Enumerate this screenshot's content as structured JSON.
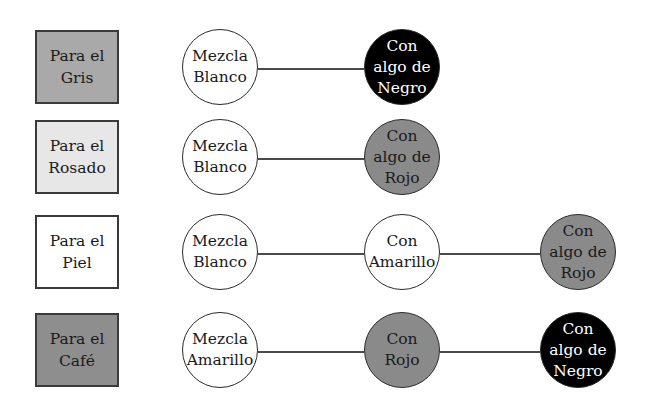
{
  "colors": {
    "gray_box": "#a9a9a9",
    "pink_box": "#e7e7e7",
    "skin_box": "#ffffff",
    "brown_box": "#8e8e8e",
    "white_circle": "#ffffff",
    "red_circle": "#8a8a8a",
    "black_circle": "#000000"
  },
  "rows": [
    {
      "box_label": "Para el\nGris",
      "steps": [
        "Mezcla\nBlanco",
        "Con\nalgo de\nNegro"
      ]
    },
    {
      "box_label": "Para el\nRosado",
      "steps": [
        "Mezcla\nBlanco",
        "Con\nalgo de\nRojo"
      ]
    },
    {
      "box_label": "Para el\nPiel",
      "steps": [
        "Mezcla\nBlanco",
        "Con\nAmarillo",
        "Con\nalgo de\nRojo"
      ]
    },
    {
      "box_label": "Para el\nCafé",
      "steps": [
        "Mezcla\nAmarillo",
        "Con\nRojo",
        "Con\nalgo de\nNegro"
      ]
    }
  ]
}
